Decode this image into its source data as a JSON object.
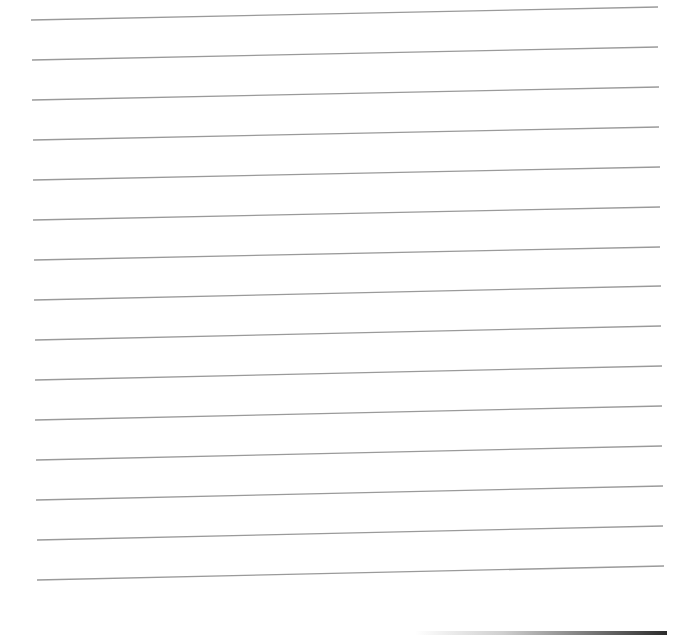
{
  "page": {
    "type": "lined-paper",
    "background_color": "#ffffff",
    "line_color": "#9a9a9a",
    "line_count": 15,
    "line_spacing_px": 40
  },
  "lines": [
    {
      "x1": 31,
      "y1": 20,
      "x2": 658,
      "y2": 7
    },
    {
      "x1": 32,
      "y1": 60,
      "x2": 658,
      "y2": 47
    },
    {
      "x1": 32,
      "y1": 100,
      "x2": 659,
      "y2": 87
    },
    {
      "x1": 33,
      "y1": 140,
      "x2": 659,
      "y2": 127
    },
    {
      "x1": 33,
      "y1": 180,
      "x2": 660,
      "y2": 167
    },
    {
      "x1": 33,
      "y1": 220,
      "x2": 660,
      "y2": 207
    },
    {
      "x1": 34,
      "y1": 260,
      "x2": 660,
      "y2": 247
    },
    {
      "x1": 34,
      "y1": 300,
      "x2": 661,
      "y2": 286
    },
    {
      "x1": 35,
      "y1": 340,
      "x2": 661,
      "y2": 326
    },
    {
      "x1": 35,
      "y1": 380,
      "x2": 662,
      "y2": 366
    },
    {
      "x1": 35,
      "y1": 420,
      "x2": 662,
      "y2": 406
    },
    {
      "x1": 36,
      "y1": 460,
      "x2": 662,
      "y2": 446
    },
    {
      "x1": 36,
      "y1": 500,
      "x2": 663,
      "y2": 486
    },
    {
      "x1": 37,
      "y1": 540,
      "x2": 663,
      "y2": 526
    },
    {
      "x1": 37,
      "y1": 580,
      "x2": 664,
      "y2": 566
    }
  ],
  "bottom_edge": {
    "description": "dark scanner edge shadow at bottom right"
  }
}
